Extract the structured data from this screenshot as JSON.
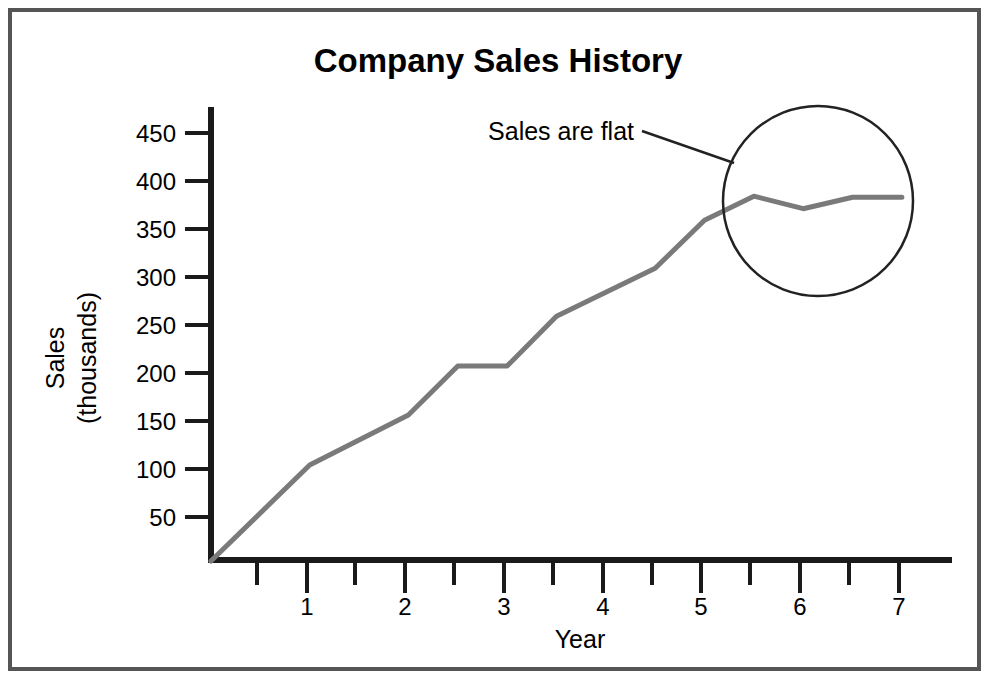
{
  "page": {
    "background_color": "#ffffff",
    "frame_color": "#555555"
  },
  "chart_data": {
    "type": "line",
    "title": "Company Sales History",
    "xlabel": "Year",
    "ylabel_line1": "Sales",
    "ylabel_line2": "(thousands)",
    "series": [
      {
        "name": "Sales",
        "color": "#7a7a7a",
        "x": [
          0,
          1,
          2,
          2.5,
          3,
          3.5,
          4.5,
          5,
          5.5,
          6,
          6.5,
          7
        ],
        "values": [
          0,
          100,
          152,
          203,
          203,
          255,
          305,
          355,
          380,
          367,
          379,
          379
        ]
      }
    ],
    "xlim": [
      0,
      7.5
    ],
    "ylim": [
      0,
      480
    ],
    "x_major_ticks": [
      1,
      2,
      3,
      4,
      5,
      6,
      7
    ],
    "x_major_tick_labels": [
      "1",
      "2",
      "3",
      "4",
      "5",
      "6",
      "7"
    ],
    "x_minor_ticks": [
      0.5,
      1.5,
      2.5,
      3.5,
      4.5,
      5.5,
      6.5
    ],
    "y_ticks": [
      50,
      100,
      150,
      200,
      250,
      300,
      350,
      400,
      450
    ],
    "y_tick_labels": [
      "50",
      "100",
      "150",
      "200",
      "250",
      "300",
      "350",
      "400",
      "450"
    ],
    "grid": false,
    "legend": null,
    "annotations": [
      {
        "text": "Sales are flat",
        "kind": "callout-with-leader-line",
        "highlight_shape": "circle",
        "highlight_center_x": 6.15,
        "highlight_center_y": 375,
        "highlight_radius_px": 95
      }
    ]
  }
}
